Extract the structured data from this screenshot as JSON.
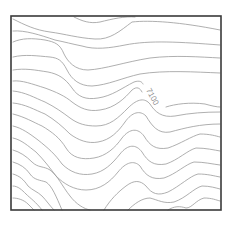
{
  "map": {
    "type": "topographic-contour-map",
    "frame": {
      "x": 11,
      "y": 16,
      "width": 210,
      "height": 194,
      "color": "#3a3a3a"
    },
    "contour_color": "#9a9a9a",
    "labels": [
      {
        "text": "7100",
        "x": 146,
        "y": 90,
        "rotate": 62
      }
    ],
    "contours": [
      "M74,17 C82,21 90,24 100,22 C112,19 125,16 135,17",
      "M13,19 C25,25 35,30 50,32 C65,34 78,38 95,39 C110,40 120,31 132,22 C150,20 180,22 220,30",
      "M13,31 C25,30 40,35 55,40 C65,42 72,44 82,46 C95,50 110,48 125,45 C150,40 180,42 220,45",
      "M13,42 C22,38 32,38 45,40 C55,42 60,44 64,54 C68,62 75,70 88,70 C105,69 125,62 150,58 C175,55 200,57 220,58",
      "M13,57 C25,54 38,56 50,57 C58,58 62,60 67,70 C72,80 80,86 92,86 C108,85 122,78 140,74 C165,70 195,72 220,73",
      "M13,70 C25,68 35,70 48,72 C58,74 65,78 72,88 C78,97 86,100 98,98 C112,96 122,88 134,82 C140,80 142,82 143,84",
      "M13,81 C22,80 32,84 45,88 C56,92 65,96 72,102 C80,108 88,112 100,110 C115,108 125,98 132,90 C137,86 140,88 142,92",
      "M166,107 C175,104 190,102 205,104 C212,106 217,107 220,107",
      "M13,91 C25,92 35,98 45,102 C55,107 62,112 70,118 C78,124 86,126 96,126 C110,126 118,118 128,108 C138,98 145,98 150,104 C155,112 162,118 175,116 C190,113 205,112 220,112",
      "M13,103 C25,104 35,110 45,114 C55,120 62,126 70,134 C78,140 88,144 98,142 C110,140 118,132 125,122 C132,112 140,110 146,116 C152,126 158,134 170,132 C185,128 200,124 220,124",
      "M13,114 C25,117 33,122 42,126 C52,132 60,138 66,148 C72,158 82,160 94,158 C106,156 115,148 122,138 C130,128 138,128 144,136 C150,146 156,150 168,148 C180,144 192,136 200,134 C210,134 216,136 220,137",
      "M13,126 C22,128 30,134 38,140 C48,148 55,154 62,164 C70,172 80,176 92,174 C104,172 112,164 120,154 C128,144 136,144 142,152 C148,162 154,166 166,164 C178,160 188,150 196,148 C206,148 214,150 220,151",
      "M13,138 C22,140 28,146 36,152 C44,160 50,168 56,176 C64,184 74,190 86,190 C100,190 110,182 118,172 C126,162 134,160 140,166 C146,176 152,180 164,178 C176,174 186,164 194,162 C204,162 212,164 220,165",
      "M13,150 C20,152 26,156 32,162 C38,168 44,166 50,170 C58,176 62,186 70,196 C76,204 84,209 90,210",
      "M13,162 C20,164 26,168 30,174 C34,180 40,180 46,182 C52,186 56,196 62,210",
      "M13,174 C20,176 24,180 28,186 C32,190 38,192 42,196 C46,200 50,206 54,210",
      "M13,186 C18,186 22,190 26,194 C30,198 36,202 42,210",
      "M13,198 C18,198 24,200 28,204 C30,206 32,208 34,210",
      "M104,210 C110,200 118,192 126,186 C134,180 140,180 146,186 C152,194 158,196 168,192 C180,186 190,176 198,174 C208,174 214,176 220,177",
      "M128,210 C134,204 142,198 150,198 C158,200 164,204 174,202 C186,198 194,188 202,186 C210,186 216,188 220,189",
      "M168,210 C174,206 180,206 186,208 C192,208 196,200 204,198 C212,198 216,200 220,201"
    ]
  }
}
